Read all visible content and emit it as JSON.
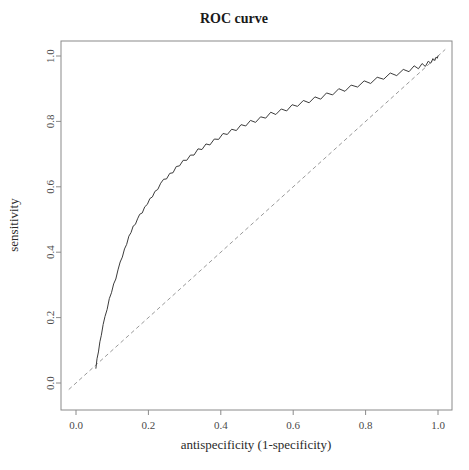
{
  "chart_data": {
    "type": "line",
    "title": "ROC curve",
    "xlabel": "antispecificity (1-specificity)",
    "ylabel": "sensitivity",
    "xlim": [
      0.0,
      1.0
    ],
    "ylim": [
      0.0,
      1.0
    ],
    "grid": false,
    "legend": "none",
    "xticks": [
      "0.0",
      "0.2",
      "0.4",
      "0.6",
      "0.8",
      "1.0"
    ],
    "xtick_values": [
      0.0,
      0.2,
      0.4,
      0.6,
      0.8,
      1.0
    ],
    "yticks": [
      "0.0",
      "0.2",
      "0.4",
      "0.6",
      "0.8",
      "1.0"
    ],
    "ytick_values": [
      0.0,
      0.2,
      0.4,
      0.6,
      0.8,
      1.0
    ],
    "series": [
      {
        "name": "ROC curve",
        "style": "solid",
        "color": "#3c3c3c",
        "x": [
          0.055,
          0.058,
          0.062,
          0.066,
          0.07,
          0.075,
          0.08,
          0.086,
          0.092,
          0.098,
          0.104,
          0.11,
          0.116,
          0.122,
          0.128,
          0.134,
          0.14,
          0.146,
          0.152,
          0.158,
          0.164,
          0.17,
          0.176,
          0.183,
          0.19,
          0.197,
          0.204,
          0.211,
          0.218,
          0.226,
          0.234,
          0.242,
          0.25,
          0.259,
          0.268,
          0.277,
          0.286,
          0.296,
          0.306,
          0.316,
          0.326,
          0.337,
          0.348,
          0.359,
          0.37,
          0.382,
          0.394,
          0.406,
          0.418,
          0.43,
          0.443,
          0.456,
          0.469,
          0.482,
          0.496,
          0.51,
          0.524,
          0.538,
          0.552,
          0.567,
          0.582,
          0.597,
          0.612,
          0.628,
          0.644,
          0.66,
          0.676,
          0.692,
          0.709,
          0.726,
          0.743,
          0.76,
          0.778,
          0.796,
          0.814,
          0.832,
          0.85,
          0.868,
          0.886,
          0.904,
          0.92,
          0.934,
          0.946,
          0.956,
          0.965,
          0.973,
          0.98,
          0.986,
          0.991,
          0.995,
          0.998,
          1.0
        ],
        "y": [
          0.045,
          0.07,
          0.098,
          0.124,
          0.15,
          0.176,
          0.202,
          0.228,
          0.254,
          0.278,
          0.3,
          0.322,
          0.344,
          0.366,
          0.388,
          0.408,
          0.428,
          0.446,
          0.462,
          0.476,
          0.488,
          0.5,
          0.512,
          0.524,
          0.536,
          0.548,
          0.56,
          0.572,
          0.584,
          0.596,
          0.608,
          0.618,
          0.628,
          0.638,
          0.648,
          0.658,
          0.667,
          0.676,
          0.685,
          0.694,
          0.702,
          0.71,
          0.718,
          0.726,
          0.734,
          0.742,
          0.75,
          0.757,
          0.764,
          0.771,
          0.778,
          0.785,
          0.791,
          0.797,
          0.803,
          0.809,
          0.815,
          0.821,
          0.827,
          0.833,
          0.839,
          0.845,
          0.851,
          0.857,
          0.863,
          0.869,
          0.875,
          0.881,
          0.887,
          0.893,
          0.899,
          0.905,
          0.911,
          0.917,
          0.923,
          0.929,
          0.935,
          0.941,
          0.947,
          0.953,
          0.958,
          0.963,
          0.967,
          0.971,
          0.975,
          0.979,
          0.983,
          0.986,
          0.99,
          0.993,
          0.996,
          1.0
        ],
        "jitter": [
          0.0,
          0.004,
          -0.003,
          0.002,
          -0.004,
          0.003,
          0.001,
          -0.003,
          0.004,
          -0.002,
          0.003,
          -0.004,
          0.002,
          0.004,
          -0.003,
          0.002,
          -0.004,
          0.003,
          -0.002,
          0.004,
          -0.003,
          0.002,
          0.004,
          -0.004,
          0.003,
          -0.002,
          0.004,
          -0.003,
          0.002,
          -0.004,
          0.003,
          0.005,
          -0.004,
          0.003,
          -0.005,
          0.004,
          -0.003,
          0.005,
          -0.004,
          0.003,
          -0.005,
          0.006,
          -0.004,
          0.005,
          -0.006,
          0.004,
          -0.005,
          0.006,
          -0.004,
          0.005,
          -0.006,
          0.005,
          -0.005,
          0.006,
          -0.006,
          0.005,
          -0.005,
          0.007,
          -0.006,
          0.005,
          -0.007,
          0.006,
          -0.005,
          0.007,
          -0.006,
          0.006,
          -0.007,
          0.006,
          -0.006,
          0.007,
          -0.007,
          0.006,
          -0.006,
          0.007,
          -0.007,
          0.006,
          -0.006,
          0.007,
          -0.007,
          0.006,
          -0.006,
          0.007,
          -0.006,
          0.006,
          -0.007,
          0.005,
          -0.005,
          0.006,
          -0.004,
          0.004,
          -0.003,
          0.0
        ]
      },
      {
        "name": "chance diagonal",
        "style": "dashed",
        "color": "#9a9a9a",
        "x": [
          -0.02,
          1.02
        ],
        "y": [
          -0.02,
          1.02
        ]
      }
    ]
  },
  "plot_geometry": {
    "frame_left": 61,
    "frame_top": 41,
    "frame_right": 452,
    "frame_bottom": 410,
    "x0_px": 76,
    "x1_px": 438,
    "y0_px": 383,
    "y1_px": 56,
    "tick_length": 5
  }
}
